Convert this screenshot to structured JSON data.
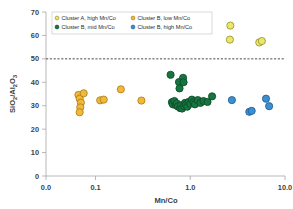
{
  "chart_data": {
    "type": "scatter",
    "title": "",
    "xlabel": "Mn/Co",
    "ylabel": "SiO2/Al2O3",
    "xscale": "log",
    "yscale": "linear",
    "xlim": [
      0.03,
      10.0
    ],
    "ylim": [
      0,
      70
    ],
    "xticks": [
      "0.0",
      "0.1",
      "1.0",
      "10.0"
    ],
    "xtick_values": [
      0.03,
      0.1,
      1.0,
      10.0
    ],
    "yticks": [
      "0",
      "10",
      "20",
      "30",
      "40",
      "50",
      "60",
      "70"
    ],
    "ytick_values": [
      0,
      10,
      20,
      30,
      40,
      50,
      60,
      70
    ],
    "grid": false,
    "legend_position": "top-left-inside",
    "annotations": [
      {
        "name": "reference-line",
        "type": "hline",
        "y": 50,
        "style": "dashed",
        "color": "#3a3a3a"
      }
    ],
    "series": [
      {
        "name": "Cluster A, high Mn/Co",
        "color": "#e9e86a",
        "edge_color": "#9a9230",
        "points": [
          {
            "x": 2.65,
            "y": 64.2
          },
          {
            "x": 2.62,
            "y": 58.2
          },
          {
            "x": 5.35,
            "y": 57.0
          },
          {
            "x": 5.7,
            "y": 57.6
          }
        ]
      },
      {
        "name": "Cluster B, low Mn/Co",
        "color": "#f0b93c",
        "edge_color": "#b07d12",
        "points": [
          {
            "x": 0.066,
            "y": 34.6
          },
          {
            "x": 0.068,
            "y": 33.0
          },
          {
            "x": 0.07,
            "y": 31.3
          },
          {
            "x": 0.069,
            "y": 29.3
          },
          {
            "x": 0.068,
            "y": 27.2
          },
          {
            "x": 0.075,
            "y": 35.3
          },
          {
            "x": 0.112,
            "y": 32.3
          },
          {
            "x": 0.122,
            "y": 32.6
          },
          {
            "x": 0.185,
            "y": 37.0
          },
          {
            "x": 0.305,
            "y": 32.2
          }
        ]
      },
      {
        "name": "Cluster B, mid Mn/Co",
        "color": "#17753f",
        "edge_color": "#0c4b28",
        "points": [
          {
            "x": 0.62,
            "y": 43.2
          },
          {
            "x": 0.64,
            "y": 31.5
          },
          {
            "x": 0.655,
            "y": 30.6
          },
          {
            "x": 0.68,
            "y": 32.0
          },
          {
            "x": 0.7,
            "y": 30.3
          },
          {
            "x": 0.72,
            "y": 31.0
          },
          {
            "x": 0.74,
            "y": 29.7
          },
          {
            "x": 0.76,
            "y": 40.1
          },
          {
            "x": 0.77,
            "y": 37.4
          },
          {
            "x": 0.78,
            "y": 29.0
          },
          {
            "x": 0.8,
            "y": 30.2
          },
          {
            "x": 0.82,
            "y": 28.8
          },
          {
            "x": 0.84,
            "y": 41.9
          },
          {
            "x": 0.85,
            "y": 40.0
          },
          {
            "x": 0.86,
            "y": 29.8
          },
          {
            "x": 0.88,
            "y": 31.2
          },
          {
            "x": 0.9,
            "y": 30.4
          },
          {
            "x": 0.93,
            "y": 29.6
          },
          {
            "x": 0.96,
            "y": 31.6
          },
          {
            "x": 1.0,
            "y": 30.8
          },
          {
            "x": 1.04,
            "y": 32.6
          },
          {
            "x": 1.08,
            "y": 31.4
          },
          {
            "x": 1.12,
            "y": 30.6
          },
          {
            "x": 1.2,
            "y": 32.4
          },
          {
            "x": 1.28,
            "y": 31.2
          },
          {
            "x": 1.38,
            "y": 32.0
          },
          {
            "x": 1.52,
            "y": 31.6
          },
          {
            "x": 1.7,
            "y": 34.0
          }
        ]
      },
      {
        "name": "Cluster B, high Mn/Co",
        "color": "#3c8fd0",
        "edge_color": "#1f5f96",
        "points": [
          {
            "x": 2.75,
            "y": 32.4
          },
          {
            "x": 4.2,
            "y": 27.4
          },
          {
            "x": 4.45,
            "y": 27.8
          },
          {
            "x": 6.3,
            "y": 33.0
          },
          {
            "x": 6.8,
            "y": 29.8
          }
        ]
      }
    ]
  },
  "legend": {
    "entries": [
      {
        "label": "Cluster A, high Mn/Co"
      },
      {
        "label": "Cluster B, low Mn/Co"
      },
      {
        "label": "Cluster B, mid Mn/Co"
      },
      {
        "label": "Cluster B, high Mn/Co"
      }
    ]
  },
  "axes": {
    "x_title": "Mn/Co",
    "y_title_parts": {
      "si": "SiO",
      "si_sub": "2",
      "slash": "/Al",
      "al_sub": "2",
      "o": "O",
      "o_sub": "3"
    }
  }
}
